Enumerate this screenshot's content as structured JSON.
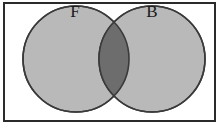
{
  "figure": {
    "kind": "venn-diagram",
    "width": 223,
    "height": 128,
    "background_color": "#ffffff",
    "border": {
      "color": "#2b2b2b",
      "width": 2,
      "x": 3,
      "y": 2,
      "w": 213,
      "h": 120
    }
  },
  "sets": [
    {
      "id": "set-f",
      "label": "F",
      "label_x": 75,
      "label_y": 13,
      "cx": 76,
      "cy": 59,
      "r": 54,
      "fill": "#b9b9b9",
      "stroke": "#3a3a3a"
    },
    {
      "id": "set-b",
      "label": "B",
      "label_x": 152,
      "label_y": 13,
      "cx": 152,
      "cy": 59,
      "r": 54,
      "fill": "#b9b9b9",
      "stroke": "#3a3a3a"
    }
  ],
  "intersection": {
    "id": "set-f-and-b",
    "label": "",
    "fill": "#6d6d6d",
    "stroke": "#3a3a3a"
  }
}
